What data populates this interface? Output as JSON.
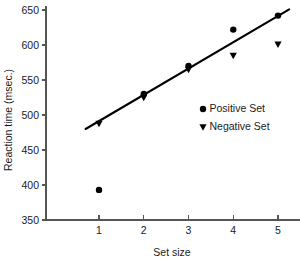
{
  "chart_data": {
    "type": "scatter",
    "title": "",
    "xlabel": "Set size",
    "ylabel": "Reaction time (msec.)",
    "x": [
      1,
      2,
      3,
      4,
      5
    ],
    "xlim": [
      0.55,
      5.45
    ],
    "ylim": [
      350,
      650
    ],
    "xticks": [
      "1",
      "2",
      "3",
      "4",
      "5"
    ],
    "yticks": [
      "350",
      "400",
      "450",
      "500",
      "550",
      "600",
      "650"
    ],
    "ytick_values": [
      350,
      400,
      450,
      500,
      550,
      600,
      650
    ],
    "grid": false,
    "legend_position": "center-right",
    "series": [
      {
        "name": "Positive Set",
        "marker": "circle",
        "color": "#000000",
        "values": [
          393,
          530,
          570,
          622,
          642
        ]
      },
      {
        "name": "Negative Set",
        "marker": "triangle-down",
        "color": "#000000",
        "values": [
          488,
          525,
          565,
          585,
          601
        ]
      }
    ],
    "fit_line": {
      "name": "regression-line",
      "color": "#000000",
      "x_start": 0.7,
      "y_start": 480,
      "x_end": 5.25,
      "y_end": 651
    }
  },
  "legend": {
    "entries": [
      {
        "label": "Positive Set",
        "marker": "circle"
      },
      {
        "label": "Negative Set",
        "marker": "triangle-down"
      }
    ]
  }
}
